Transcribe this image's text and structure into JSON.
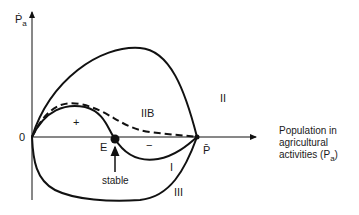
{
  "diagram": {
    "y_axis_label": "Ṗ",
    "y_axis_label_sub": "a",
    "origin_label": "0",
    "x_axis_label_lines": [
      "Population in",
      "agricultural",
      "activities (P"
    ],
    "x_axis_label_sub": "a",
    "x_axis_label_close": ")",
    "p_bar_label": "P̄",
    "equilibrium_label": "E",
    "stable_label": "stable",
    "plus_sign": "+",
    "minus_sign": "−",
    "curve_labels": {
      "I": "I",
      "II": "II",
      "IIB": "IIB",
      "III": "III"
    },
    "curves": [
      {
        "name": "I",
        "style": "solid",
        "description": "rises from origin, crosses axis at E (stable), dips below axis, returns to P̄"
      },
      {
        "name": "II",
        "style": "solid",
        "description": "large positive hump from origin to P̄"
      },
      {
        "name": "IIB",
        "style": "dashed",
        "description": "positive hump from origin, stays above axis, meets P̄"
      },
      {
        "name": "III",
        "style": "solid",
        "description": "negative trough from origin to P̄"
      }
    ],
    "colors": {
      "line": "#111111",
      "background": "#ffffff"
    }
  }
}
